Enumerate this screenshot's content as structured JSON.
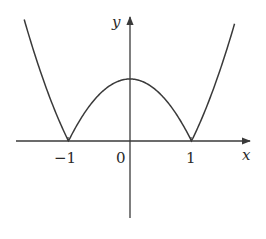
{
  "chart_data": {
    "type": "line",
    "title": "",
    "function": "y = |x^2 - 1|",
    "xlabel": "x",
    "ylabel": "y",
    "x_ticks": [
      {
        "value": -1,
        "label": "−1"
      },
      {
        "value": 0,
        "label": "0"
      },
      {
        "value": 1,
        "label": "1"
      }
    ],
    "xlim": [
      -2.1,
      2.0
    ],
    "ylim": [
      -1.55,
      2.2
    ],
    "grid": false,
    "legend": null,
    "series": [
      {
        "name": "f(x)",
        "x": [
          -1.72,
          -1.5,
          -1.25,
          -1.0,
          -0.75,
          -0.5,
          -0.25,
          0,
          0.25,
          0.5,
          0.75,
          1.0,
          1.25,
          1.5,
          1.7
        ],
        "y": [
          1.96,
          1.25,
          0.5625,
          0,
          0.4375,
          0.75,
          0.9375,
          1.0,
          0.9375,
          0.75,
          0.4375,
          0,
          0.5625,
          1.25,
          1.89
        ]
      }
    ],
    "key_points": [
      {
        "x": -1,
        "y": 0
      },
      {
        "x": 0,
        "y": 1
      },
      {
        "x": 1,
        "y": 0
      }
    ]
  },
  "labels": {
    "x_axis": "x",
    "y_axis": "y",
    "tick_neg1": "−1",
    "tick_0": "0",
    "tick_1": "1"
  },
  "colors": {
    "curve": "#3a3a3a",
    "axes": "#3a3a3a"
  }
}
